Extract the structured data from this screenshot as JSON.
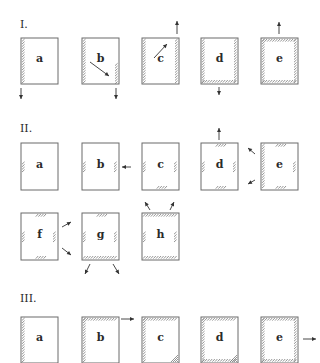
{
  "sections": [
    {
      "label": "I.",
      "pos": [
        20,
        28
      ],
      "panels": [
        {
          "id": "a",
          "x": 21,
          "y": 38,
          "w": 37,
          "h": 46,
          "hatch": [
            "left"
          ],
          "arrows": [
            {
              "x1": 21,
              "y1": 88,
              "x2": 21,
              "y2": 99
            }
          ]
        },
        {
          "id": "b",
          "x": 82,
          "y": 38,
          "w": 37,
          "h": 46,
          "hatch": [
            "left",
            "right-lower"
          ],
          "arrows": [
            {
              "x1": 90,
              "y1": 62,
              "x2": 109,
              "y2": 76
            },
            {
              "x1": 116,
              "y1": 88,
              "x2": 116,
              "y2": 99
            }
          ]
        },
        {
          "id": "c",
          "x": 142,
          "y": 38,
          "w": 37,
          "h": 46,
          "hatch": [
            "left",
            "right"
          ],
          "arrows": [
            {
              "x1": 154,
              "y1": 58,
              "x2": 167,
              "y2": 44
            },
            {
              "x1": 177,
              "y1": 34,
              "x2": 177,
              "y2": 21
            }
          ]
        },
        {
          "id": "d",
          "x": 201,
          "y": 38,
          "w": 37,
          "h": 46,
          "hatch": [
            "left",
            "right",
            "bottom"
          ],
          "arrows": [
            {
              "x1": 219,
              "y1": 87,
              "x2": 219,
              "y2": 95
            }
          ]
        },
        {
          "id": "e",
          "x": 261,
          "y": 38,
          "w": 37,
          "h": 46,
          "hatch": [
            "left",
            "right",
            "top",
            "bottom"
          ],
          "arrows": [
            {
              "x1": 279,
              "y1": 34,
              "x2": 279,
              "y2": 22
            }
          ]
        }
      ]
    },
    {
      "label": "II.",
      "pos": [
        20,
        132
      ],
      "panels": [
        {
          "id": "a",
          "x": 21,
          "y": 143,
          "w": 37,
          "h": 47,
          "hatch": [
            "left-mid"
          ],
          "arrows": []
        },
        {
          "id": "b",
          "x": 82,
          "y": 143,
          "w": 37,
          "h": 47,
          "hatch": [
            "left-mid",
            "right-mid"
          ],
          "arrows": [
            {
              "x1": 131,
              "y1": 167,
              "x2": 122,
              "y2": 167
            }
          ]
        },
        {
          "id": "c",
          "x": 142,
          "y": 143,
          "w": 37,
          "h": 47,
          "hatch": [
            "left-mid",
            "right-mid",
            "bottom-mid"
          ],
          "arrows": []
        },
        {
          "id": "d",
          "x": 201,
          "y": 143,
          "w": 37,
          "h": 47,
          "hatch": [
            "left-mid",
            "right-mid",
            "bottom-mid",
            "top-mid"
          ],
          "arrows": [
            {
              "x1": 219,
              "y1": 140,
              "x2": 219,
              "y2": 128
            }
          ]
        },
        {
          "id": "e",
          "x": 261,
          "y": 143,
          "w": 37,
          "h": 47,
          "hatch": [
            "left",
            "right-mid",
            "bottom-mid",
            "top-mid"
          ],
          "arrows": [
            {
              "x1": 255,
              "y1": 154,
              "x2": 248,
              "y2": 148
            },
            {
              "x1": 255,
              "y1": 180,
              "x2": 248,
              "y2": 184
            }
          ]
        },
        {
          "id": "f",
          "x": 21,
          "y": 213,
          "w": 37,
          "h": 47,
          "hatch": [
            "left-mid",
            "right-mid",
            "bottom-mid",
            "top-mid"
          ],
          "arrows": [
            {
              "x1": 62,
              "y1": 227,
              "x2": 71,
              "y2": 222
            },
            {
              "x1": 62,
              "y1": 248,
              "x2": 71,
              "y2": 255
            }
          ]
        },
        {
          "id": "g",
          "x": 82,
          "y": 213,
          "w": 37,
          "h": 47,
          "hatch": [
            "left-mid",
            "right-mid",
            "bottom",
            "top-mid"
          ],
          "arrows": [
            {
              "x1": 90,
              "y1": 264,
              "x2": 85,
              "y2": 274
            },
            {
              "x1": 113,
              "y1": 264,
              "x2": 119,
              "y2": 274
            }
          ]
        },
        {
          "id": "h",
          "x": 142,
          "y": 213,
          "w": 37,
          "h": 47,
          "hatch": [
            "left-mid",
            "right-mid",
            "bottom",
            "top"
          ],
          "arrows": [
            {
              "x1": 150,
              "y1": 210,
              "x2": 145,
              "y2": 202
            },
            {
              "x1": 170,
              "y1": 210,
              "x2": 174,
              "y2": 202
            }
          ]
        }
      ]
    },
    {
      "label": "III.",
      "pos": [
        20,
        302
      ],
      "panels": [
        {
          "id": "a",
          "x": 21,
          "y": 317,
          "w": 37,
          "h": 46,
          "hatch": [
            "left"
          ],
          "arrows": []
        },
        {
          "id": "b",
          "x": 82,
          "y": 317,
          "w": 37,
          "h": 46,
          "hatch": [
            "left",
            "top"
          ],
          "arrows": [
            {
              "x1": 121,
              "y1": 319,
              "x2": 134,
              "y2": 319
            }
          ]
        },
        {
          "id": "c",
          "x": 142,
          "y": 317,
          "w": 37,
          "h": 46,
          "hatch": [
            "left",
            "top",
            "corner-br"
          ],
          "arrows": []
        },
        {
          "id": "d",
          "x": 201,
          "y": 317,
          "w": 37,
          "h": 46,
          "hatch": [
            "left",
            "top",
            "bottom",
            "corner-br"
          ],
          "arrows": []
        },
        {
          "id": "e",
          "x": 261,
          "y": 317,
          "w": 37,
          "h": 46,
          "hatch": [
            "left",
            "right",
            "top",
            "bottom"
          ],
          "arrows": [
            {
              "x1": 303,
              "y1": 339,
              "x2": 316,
              "y2": 339
            }
          ]
        }
      ]
    }
  ],
  "colors": {
    "frame": "#6a6a6a",
    "hatch": "#7a7a7a",
    "arrow": "#333333",
    "text": "#2a2a2a"
  }
}
